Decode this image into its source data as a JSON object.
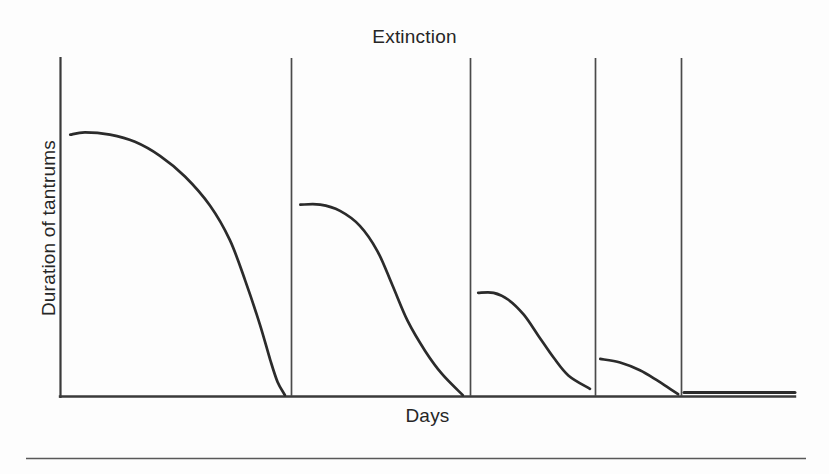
{
  "figure": {
    "title": "Extinction",
    "x_axis_label": "Days",
    "y_axis_label": "Duration of tantrums",
    "stroke_color": "#2b2b2b",
    "axis_color": "#3a3a3a",
    "divider_color": "#4a4a4a",
    "background_color": "#fdfdfd",
    "footer_rule_color": "#595959"
  },
  "chart_data": {
    "type": "line",
    "title": "Extinction",
    "xlabel": "Days",
    "ylabel": "Duration of tantrums",
    "xlim": [
      0,
      100
    ],
    "ylim": [
      0,
      100
    ],
    "grid": false,
    "legend": "none",
    "axis_ticks": {
      "x": [],
      "y": []
    },
    "session_dividers_x": [
      31.4,
      55.8,
      72.8,
      84.4
    ],
    "series": [
      {
        "name": "Session 1",
        "start_x": 1.4,
        "end_x": 30.6,
        "start_y": 87.4,
        "end_y": 0.3,
        "shape": "sigmoid-decay",
        "points": [
          [
            1.4,
            87.4
          ],
          [
            3.4,
            88.2
          ],
          [
            6.8,
            87.4
          ],
          [
            10.2,
            85.0
          ],
          [
            13.6,
            80.3
          ],
          [
            17.0,
            73.4
          ],
          [
            20.4,
            63.7
          ],
          [
            23.1,
            52.2
          ],
          [
            25.2,
            38.6
          ],
          [
            27.2,
            23.9
          ],
          [
            28.6,
            12.1
          ],
          [
            29.6,
            4.7
          ],
          [
            30.6,
            0.3
          ]
        ]
      },
      {
        "name": "Session 2",
        "start_x": 32.7,
        "end_x": 54.8,
        "start_y": 64.0,
        "end_y": 0.3,
        "shape": "sigmoid-decay",
        "points": [
          [
            32.7,
            64.0
          ],
          [
            35.4,
            64.0
          ],
          [
            38.1,
            61.9
          ],
          [
            40.8,
            56.9
          ],
          [
            43.2,
            48.4
          ],
          [
            45.2,
            37.2
          ],
          [
            47.3,
            25.1
          ],
          [
            49.7,
            15.0
          ],
          [
            52.0,
            7.3
          ],
          [
            54.8,
            0.3
          ]
        ]
      },
      {
        "name": "Session 3",
        "start_x": 56.9,
        "end_x": 72.1,
        "start_y": 34.5,
        "end_y": 2.4,
        "shape": "sigmoid-decay",
        "points": [
          [
            56.9,
            34.5
          ],
          [
            59.0,
            34.5
          ],
          [
            61.0,
            32.2
          ],
          [
            63.1,
            27.2
          ],
          [
            65.1,
            20.1
          ],
          [
            67.2,
            12.7
          ],
          [
            69.2,
            6.8
          ],
          [
            72.1,
            2.4
          ]
        ]
      },
      {
        "name": "Session 4",
        "start_x": 73.5,
        "end_x": 84.1,
        "start_y": 12.4,
        "end_y": 0.6,
        "shape": "concave-decay",
        "points": [
          [
            73.5,
            12.4
          ],
          [
            76.2,
            11.2
          ],
          [
            78.9,
            8.6
          ],
          [
            81.2,
            5.3
          ],
          [
            82.8,
            2.7
          ],
          [
            84.1,
            0.6
          ]
        ]
      },
      {
        "name": "Session 5",
        "start_x": 84.9,
        "end_x": 100.0,
        "start_y": 1.2,
        "end_y": 1.2,
        "shape": "flat",
        "points": [
          [
            84.9,
            1.2
          ],
          [
            100.0,
            1.2
          ]
        ]
      }
    ]
  }
}
